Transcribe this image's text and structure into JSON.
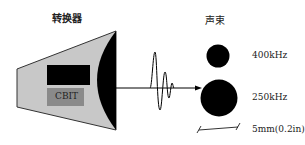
{
  "labels": {
    "transducer": "转换器",
    "beam": "声束",
    "cbit": "CBIT",
    "freq_high": "400kHz",
    "freq_low": "250kHz",
    "scale": "5mm(0.2in)"
  },
  "colors": {
    "housing": "#c8c8c8",
    "cbit_box": "#8a8a8a",
    "ink": "#000000"
  }
}
